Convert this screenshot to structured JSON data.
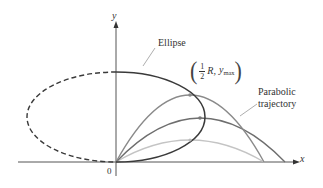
{
  "figure": {
    "axes": {
      "x_label": "x",
      "y_label": "y",
      "origin_label": "0"
    },
    "labels": {
      "ellipse": "Ellipse",
      "point": {
        "fraction_numerator": "1",
        "fraction_denominator": "2",
        "r": "R,",
        "y": "y",
        "y_subscript": "max"
      },
      "parabolic_line1": "Parabolic",
      "parabolic_line2": "trajectory"
    },
    "curves": [
      {
        "name": "ellipse",
        "style": "dashed-left/solid-right",
        "color": "#3a3a3a"
      },
      {
        "name": "parabola-high",
        "color": "#7a7a7a"
      },
      {
        "name": "parabola-mid",
        "color": "#6a6a6a"
      },
      {
        "name": "parabola-low",
        "color": "#bdbdbd"
      }
    ]
  }
}
